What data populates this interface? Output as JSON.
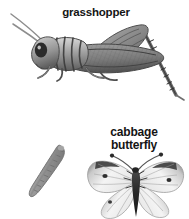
{
  "page": {
    "background_color": "#ffffff",
    "width": 189,
    "height": 219,
    "kind": "insect-illustration-plate"
  },
  "labels": {
    "grasshopper": "grasshopper",
    "butterfly": "cabbage\nbutterfly",
    "text_color": "#141414"
  },
  "figures": {
    "grasshopper": {
      "name": "grasshopper",
      "description": "side view of a grasshopper facing left with long curved antennae, large dark eye, striped thorax, cross-hatched folded wing and large triangular hind leg with serrated tibia",
      "tone_dark": "#3a3a3a",
      "tone_mid": "#8e8e8e",
      "tone_light": "#c9c9c9"
    },
    "caterpillar": {
      "name": "caterpillar",
      "description": "elongated segmented gray caterpillar angled from upper right to lower left",
      "tone_dark": "#6f6f6f",
      "tone_mid": "#9a9a9a",
      "tone_light": "#bdbdbd"
    },
    "butterfly": {
      "name": "cabbage butterfly",
      "description": "cabbage white butterfly with wings spread, pale veined wings, dark gray wing tips, dark spots, dark body and clubbed antennae",
      "tone_dark": "#2e2e2e",
      "tone_mid": "#8d8d8d",
      "tone_light": "#f2f2f2"
    }
  }
}
